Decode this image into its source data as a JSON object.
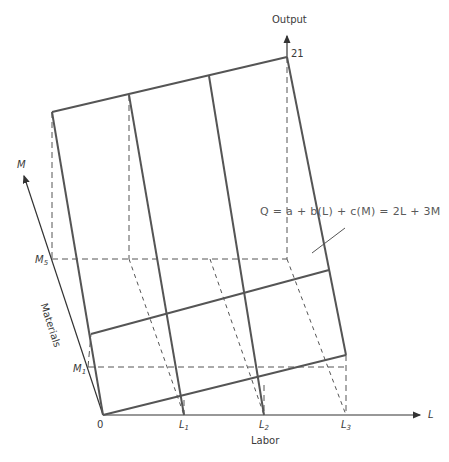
{
  "diagram": {
    "type": "3d-production-surface",
    "colors": {
      "solid": "#555555",
      "axis": "#333333",
      "dashed": "#555555",
      "text": "#3a3a3a"
    },
    "axes": {
      "output": {
        "label": "Output",
        "max_value_label": "21"
      },
      "labor": {
        "axis_letter": "L",
        "label": "Labor",
        "ticks": [
          {
            "base": "L",
            "sub": "1"
          },
          {
            "base": "L",
            "sub": "2"
          },
          {
            "base": "L",
            "sub": "3"
          }
        ]
      },
      "materials": {
        "axis_letter": "M",
        "label": "Materials",
        "ticks": [
          {
            "base": "M",
            "sub": "1"
          },
          {
            "base": "M",
            "sub": "5"
          }
        ]
      },
      "origin": "0"
    },
    "equation": "Q = a + b(L) + c(M) = 2L + 3M"
  }
}
